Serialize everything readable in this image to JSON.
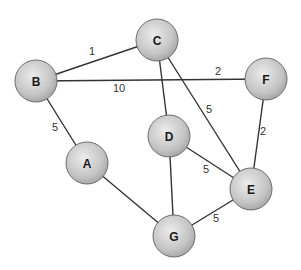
{
  "nodes": [
    {
      "id": "B",
      "label": "B",
      "x": 36,
      "y": 81,
      "r": 21
    },
    {
      "id": "C",
      "label": "C",
      "x": 157,
      "y": 40,
      "r": 21
    },
    {
      "id": "F",
      "label": "F",
      "x": 266,
      "y": 79,
      "r": 21
    },
    {
      "id": "D",
      "label": "D",
      "x": 169,
      "y": 136,
      "r": 21
    },
    {
      "id": "A",
      "label": "A",
      "x": 87,
      "y": 163,
      "r": 21
    },
    {
      "id": "E",
      "label": "E",
      "x": 251,
      "y": 189,
      "r": 21
    },
    {
      "id": "G",
      "label": "G",
      "x": 174,
      "y": 236,
      "r": 21
    }
  ],
  "edges": [
    {
      "from": "B",
      "to": "C",
      "weight": "1",
      "lx": 92,
      "ly": 51
    },
    {
      "from": "B",
      "to": "F",
      "weight": "10",
      "lx": 119,
      "ly": 88
    },
    {
      "from": "B",
      "to": "F",
      "weight": "2",
      "lx": 218,
      "ly": 71,
      "hidden_line": true
    },
    {
      "from": "B",
      "to": "A",
      "weight": "5",
      "lx": 55,
      "ly": 127
    },
    {
      "from": "C",
      "to": "D",
      "weight": "",
      "lx": 0,
      "ly": 0
    },
    {
      "from": "C",
      "to": "E",
      "weight": "5",
      "lx": 209,
      "ly": 109
    },
    {
      "from": "F",
      "to": "E",
      "weight": "2",
      "lx": 263,
      "ly": 131
    },
    {
      "from": "D",
      "to": "E",
      "weight": "5",
      "lx": 206,
      "ly": 169
    },
    {
      "from": "D",
      "to": "G",
      "weight": "",
      "lx": 0,
      "ly": 0
    },
    {
      "from": "A",
      "to": "G",
      "weight": "",
      "lx": 0,
      "ly": 0
    },
    {
      "from": "G",
      "to": "E",
      "weight": "5",
      "lx": 216,
      "ly": 218
    }
  ],
  "colors": {
    "node_fill_center": "#e6e6e6",
    "node_fill_edge": "#a8a8a8",
    "edge": "#333333",
    "background": "#ffffff"
  }
}
